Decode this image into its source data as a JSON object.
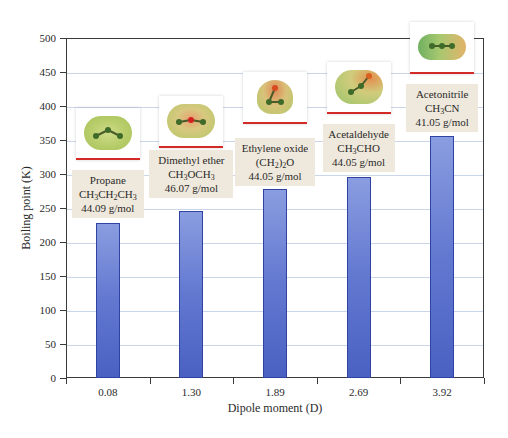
{
  "chart_data": {
    "type": "bar",
    "title": "",
    "xlabel": "Dipole moment (D)",
    "ylabel": "Boiling point (K)",
    "ylim": [
      0,
      500
    ],
    "yticks": [
      0,
      50,
      100,
      150,
      200,
      250,
      300,
      350,
      400,
      450,
      500
    ],
    "grid": true,
    "categories": [
      "0.08",
      "1.30",
      "1.89",
      "2.69",
      "3.92"
    ],
    "values": [
      228,
      246,
      278,
      296,
      356
    ],
    "annotations": [
      {
        "name": "Propane",
        "formula": "CH3CH2CH3",
        "formula_html": [
          "CH",
          "3",
          "CH",
          "2",
          "CH",
          "3"
        ],
        "molar_mass": "44.09 g/mol"
      },
      {
        "name": "Dimethyl ether",
        "formula": "CH3OCH3",
        "formula_html": [
          "CH",
          "3",
          "OCH",
          "3"
        ],
        "molar_mass": "46.07 g/mol"
      },
      {
        "name": "Ethylene oxide",
        "formula": "(CH2)2O",
        "formula_html": [
          "(CH",
          "2",
          ")",
          "2",
          "O"
        ],
        "molar_mass": "44.05 g/mol"
      },
      {
        "name": "Acetaldehyde",
        "formula": "CH3CHO",
        "formula_html": [
          "CH",
          "3",
          "CHO"
        ],
        "molar_mass": "44.05 g/mol"
      },
      {
        "name": "Acetonitrile",
        "formula": "CH3CN",
        "formula_html": [
          "CH",
          "3",
          "CN"
        ],
        "molar_mass": "41.05 g/mol"
      }
    ]
  },
  "colors": {
    "bar_fill_top": "#8a9de0",
    "bar_fill_bottom": "#4a61c2",
    "bar_border": "#2f43a3",
    "gridline": "#c9d6ea",
    "label_box": "#efe8dc",
    "card_underline": "#d32a26"
  }
}
